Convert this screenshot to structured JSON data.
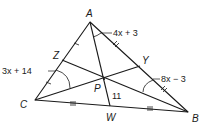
{
  "diagram": {
    "type": "triangle-with-cevians",
    "vertices": {
      "A": "A",
      "B": "B",
      "C": "C"
    },
    "points": {
      "P": "P",
      "Z": "Z",
      "Y": "Y",
      "W": "W"
    },
    "labels": {
      "angle_A_expr": "4x + 3",
      "angle_C_expr": "3x + 14",
      "angle_B_expr": "8x − 3",
      "segment_PW": "11"
    }
  }
}
